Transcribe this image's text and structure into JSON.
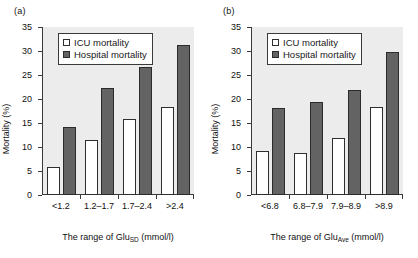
{
  "figure": {
    "panels": [
      {
        "label": "(a)",
        "ylabel": "Mortality (%)",
        "xlabel_prefix": "The range of Glu",
        "xlabel_sub": "SD",
        "xlabel_suffix": " (mmol/l)",
        "legend": [
          {
            "name": "icu",
            "label": "ICU mortality",
            "color": "#ffffff"
          },
          {
            "name": "hospital",
            "label": "Hospital mortality",
            "color": "#636363"
          }
        ],
        "categories": [
          "<1.2",
          "1.2–1.7",
          "1.7–2.4",
          ">2.4"
        ],
        "yticks": [
          "0",
          "5",
          "10",
          "15",
          "20",
          "25",
          "30",
          "35"
        ],
        "series": [
          {
            "name": "ICU mortality",
            "values": [
              5.8,
              11.5,
              15.8,
              18.3
            ]
          },
          {
            "name": "Hospital mortality",
            "values": [
              14.2,
              22.3,
              26.6,
              31.2
            ]
          }
        ]
      },
      {
        "label": "(b)",
        "ylabel": "Mortality (%)",
        "xlabel_prefix": "The range of Glu",
        "xlabel_sub": "Ave",
        "xlabel_suffix": " (mmol/l)",
        "legend": [
          {
            "name": "icu",
            "label": "ICU mortality",
            "color": "#ffffff"
          },
          {
            "name": "hospital",
            "label": "Hospital mortality",
            "color": "#636363"
          }
        ],
        "categories": [
          "<6.8",
          "6.8–7.9",
          "7.9–8.9",
          ">8.9"
        ],
        "yticks": [
          "0",
          "5",
          "10",
          "15",
          "20",
          "25",
          "30",
          "35"
        ],
        "series": [
          {
            "name": "ICU mortality",
            "values": [
              9.1,
              8.8,
              11.8,
              18.3
            ]
          },
          {
            "name": "Hospital mortality",
            "values": [
              18.2,
              19.3,
              21.8,
              29.7
            ]
          }
        ]
      }
    ]
  },
  "chart_data": [
    {
      "type": "bar",
      "title": "(a)",
      "categories": [
        "<1.2",
        "1.2–1.7",
        "1.7–2.4",
        ">2.4"
      ],
      "series": [
        {
          "name": "ICU mortality",
          "values": [
            5.8,
            11.5,
            15.8,
            18.3
          ]
        },
        {
          "name": "Hospital mortality",
          "values": [
            14.2,
            22.3,
            26.6,
            31.2
          ]
        }
      ],
      "xlabel": "The range of GluSD (mmol/l)",
      "ylabel": "Mortality (%)",
      "ylim": [
        0,
        35
      ],
      "yticks": [
        0,
        5,
        10,
        15,
        20,
        25,
        30,
        35
      ],
      "grid": false,
      "legend_position": "top-left"
    },
    {
      "type": "bar",
      "title": "(b)",
      "categories": [
        "<6.8",
        "6.8–7.9",
        "7.9–8.9",
        ">8.9"
      ],
      "series": [
        {
          "name": "ICU mortality",
          "values": [
            9.1,
            8.8,
            11.8,
            18.3
          ]
        },
        {
          "name": "Hospital mortality",
          "values": [
            18.2,
            19.3,
            21.8,
            29.7
          ]
        }
      ],
      "xlabel": "The range of GluAve (mmol/l)",
      "ylabel": "Mortality (%)",
      "ylim": [
        0,
        35
      ],
      "yticks": [
        0,
        5,
        10,
        15,
        20,
        25,
        30,
        35
      ],
      "grid": false,
      "legend_position": "top-left"
    }
  ]
}
